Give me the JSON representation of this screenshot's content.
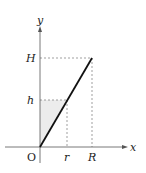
{
  "diagram": {
    "type": "cone-cross-section-graph",
    "axes": {
      "x_label": "x",
      "y_label": "y",
      "origin_label": "O"
    },
    "ticks": {
      "x": [
        {
          "label": "r"
        },
        {
          "label": "R"
        }
      ],
      "y": [
        {
          "label": "h"
        },
        {
          "label": "H"
        }
      ]
    },
    "line": {
      "from": "O",
      "to": "(R, H)",
      "color": "#111111"
    },
    "shaded_region": {
      "description": "triangle between y-axis, y=h, and line",
      "color": "#ececec"
    },
    "guide_lines": "dashed"
  }
}
